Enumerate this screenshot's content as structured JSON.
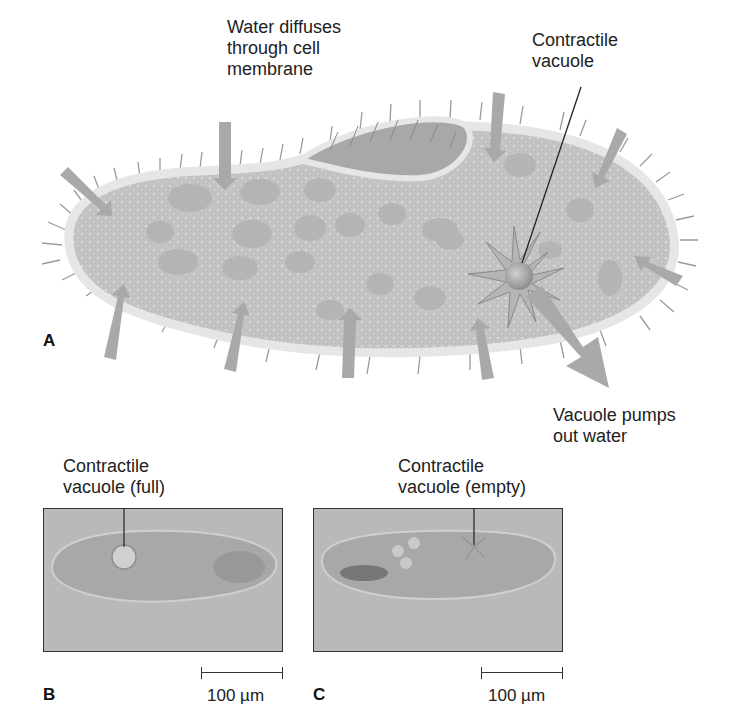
{
  "figure": {
    "panel_a": {
      "letter": "A",
      "labels": {
        "water_diffuses": "Water diffuses\nthrough cell\nmembrane",
        "contractile_vacuole": "Contractile\nvacuole",
        "vacuole_pumps": "Vacuole pumps\nout water"
      }
    },
    "panel_b": {
      "letter": "B",
      "label": "Contractile\nvacuole (full)",
      "scale": "100 µm"
    },
    "panel_c": {
      "letter": "C",
      "label": "Contractile\nvacuole (empty)",
      "scale": "100 µm"
    },
    "colors": {
      "cell_body": "#c4c4c4",
      "membrane": "#e6e6e6",
      "arrow": "#a9a9a9",
      "photo_bg": "#b9b9b9",
      "text": "#222222"
    }
  }
}
